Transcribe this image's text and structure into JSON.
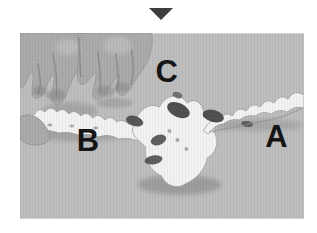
{
  "figure": {
    "alt": "Photograph of two hands bending a flexible articulated vertebral column (spine) model on a plain gray surface",
    "marker_icon": "down-triangle",
    "labels": {
      "a": "A",
      "b": "B",
      "c": "C"
    }
  },
  "colors": {
    "page_bg": "#ffffff",
    "photo_bg": "#bdbdbd",
    "marker": "#3d3d3d",
    "label": "#141414",
    "hand": "#aaaaaa",
    "hand_shadow": "#858585",
    "hand_highlight": "#c8c8c8",
    "spine": "#f2f2f2",
    "spine_shadow": "#8f8f8f",
    "disc": "#4e4e4e"
  }
}
